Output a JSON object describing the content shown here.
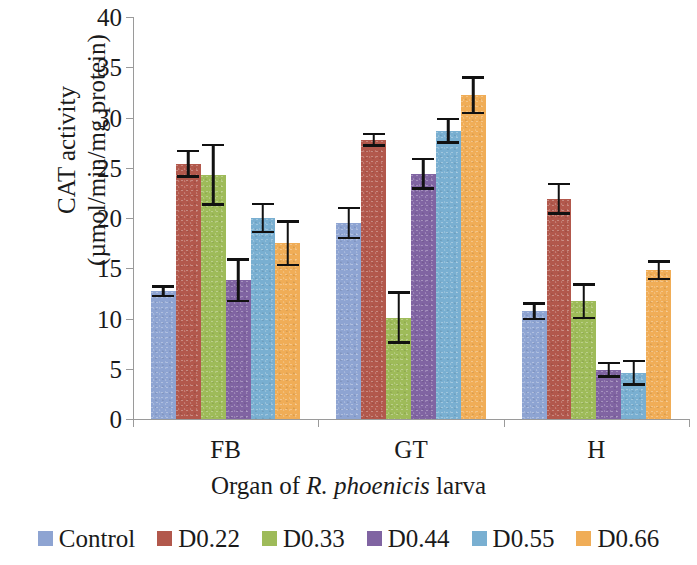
{
  "chart_data": {
    "type": "bar",
    "title": "",
    "xlabel": "Organ of R. phoenicis larva",
    "xlabel_parts": {
      "pre": "Organ of ",
      "species": "R. phoenicis",
      "post": " larva"
    },
    "ylabel": "CAT activity (µmol/min/mg protein)",
    "ylabel_lines": [
      "CAT activity",
      "(µmol/min/mg protein)"
    ],
    "categories": [
      "FB",
      "GT",
      "H"
    ],
    "ylim": [
      0,
      40
    ],
    "yticks": [
      0,
      5,
      10,
      15,
      20,
      25,
      30,
      35,
      40
    ],
    "ytick_labels": [
      "0",
      "5",
      "10",
      "15",
      "20",
      "25",
      "30",
      "35",
      "40"
    ],
    "grid": false,
    "legend_position": "bottom",
    "series": [
      {
        "name": "Control",
        "color": "#8EA4D2",
        "values": [
          12.7,
          19.5,
          10.7
        ],
        "errors": [
          0.6,
          1.6,
          0.9
        ]
      },
      {
        "name": "D0.22",
        "color": "#B2584C",
        "values": [
          25.4,
          27.8,
          21.9
        ],
        "errors": [
          1.4,
          0.7,
          1.6
        ]
      },
      {
        "name": "D0.33",
        "color": "#9EBB59",
        "values": [
          24.3,
          10.1,
          11.7
        ],
        "errors": [
          3.1,
          2.6,
          1.8
        ]
      },
      {
        "name": "D0.44",
        "color": "#8064A2",
        "values": [
          13.8,
          24.4,
          4.9
        ],
        "errors": [
          2.2,
          1.6,
          0.8
        ]
      },
      {
        "name": "D0.55",
        "color": "#79AFD1",
        "values": [
          20.0,
          28.7,
          4.6
        ],
        "errors": [
          1.5,
          1.3,
          1.3
        ]
      },
      {
        "name": "D0.66",
        "color": "#F0AD57",
        "values": [
          17.5,
          32.2,
          14.8
        ],
        "errors": [
          2.3,
          1.9,
          1.0
        ]
      }
    ]
  },
  "legend": {
    "items": [
      {
        "label": "Control",
        "color": "#8EA4D2"
      },
      {
        "label": "D0.22",
        "color": "#B2584C"
      },
      {
        "label": "D0.33",
        "color": "#9EBB59"
      },
      {
        "label": "D0.44",
        "color": "#8064A2"
      },
      {
        "label": "D0.55",
        "color": "#79AFD1"
      },
      {
        "label": "D0.66",
        "color": "#F0AD57"
      }
    ]
  }
}
